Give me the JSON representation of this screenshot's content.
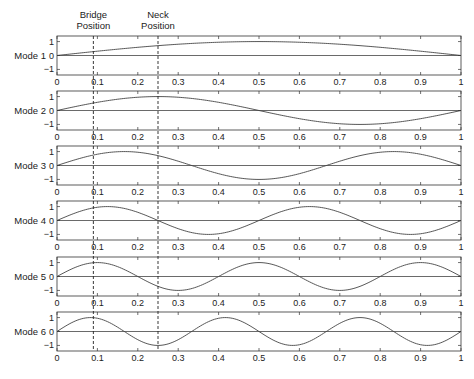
{
  "chart_data": {
    "type": "line",
    "title": "",
    "annotations": [
      {
        "label_line1": "Bridge",
        "label_line2": "Position",
        "x": 0.09
      },
      {
        "label_line1": "Neck",
        "label_line2": "Position",
        "x": 0.25
      }
    ],
    "xlim": [
      0,
      1
    ],
    "ylim": [
      -1.4,
      1.4
    ],
    "xticks": [
      "0",
      "0.1",
      "0.2",
      "0.3",
      "0.4",
      "0.5",
      "0.6",
      "0.7",
      "0.8",
      "0.9",
      "1"
    ],
    "yticks": [
      "1",
      "0",
      "−1"
    ],
    "grid": false,
    "series": [
      {
        "name": "Mode 1",
        "function": "sin(1*pi*x)"
      },
      {
        "name": "Mode 2",
        "function": "sin(2*pi*x)"
      },
      {
        "name": "Mode 3",
        "function": "sin(3*pi*x)"
      },
      {
        "name": "Mode 4",
        "function": "sin(4*pi*x)"
      },
      {
        "name": "Mode 5",
        "function": "sin(5*pi*x)"
      },
      {
        "name": "Mode 6",
        "function": "sin(6*pi*x)"
      }
    ]
  },
  "colors": {
    "axis": "#333333",
    "curve": "#444444",
    "dashed": "#222222"
  }
}
